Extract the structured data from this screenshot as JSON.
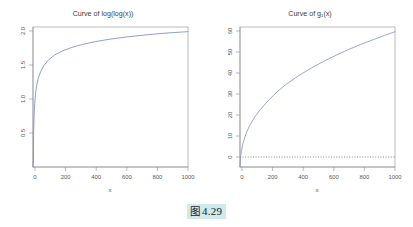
{
  "figure": {
    "caption_icon": "图",
    "caption_number": "4.29"
  },
  "chart_data": [
    {
      "type": "line",
      "title": "Curve of log(log(x))",
      "xlabel": "x",
      "ylabel": "",
      "xlim": [
        1,
        1000
      ],
      "ylim": [
        0.0,
        2.0
      ],
      "grid": false,
      "legend": null,
      "xticks": [
        0,
        200,
        400,
        600,
        800,
        1000
      ],
      "xtick_labels": [
        "0",
        "200",
        "400",
        "600",
        "800",
        "1000"
      ],
      "yticks": [
        0.5,
        1.0,
        1.5,
        2.0
      ],
      "ytick_labels": [
        "0.5",
        "1.0",
        "1.5",
        "2.0"
      ],
      "series": [
        {
          "name": "log(log(x))",
          "color": "#7a8cc4",
          "x": [
            1,
            3,
            5,
            8,
            12,
            18,
            25,
            35,
            50,
            70,
            100,
            140,
            190,
            250,
            320,
            400,
            500,
            600,
            700,
            800,
            900,
            1000
          ],
          "y": [
            0.0,
            0.094,
            0.476,
            0.733,
            0.908,
            1.059,
            1.169,
            1.269,
            1.36,
            1.446,
            1.527,
            1.6,
            1.658,
            1.707,
            1.751,
            1.79,
            1.827,
            1.857,
            1.881,
            1.902,
            1.92,
            1.933
          ]
        }
      ]
    },
    {
      "type": "line",
      "title": "Curve of g₁(x)",
      "xlabel": "x",
      "ylabel": "",
      "xlim": [
        1,
        1000
      ],
      "ylim": [
        0,
        62
      ],
      "grid": false,
      "legend": null,
      "xticks": [
        0,
        200,
        400,
        600,
        800,
        1000
      ],
      "xtick_labels": [
        "0",
        "200",
        "400",
        "600",
        "800",
        "1000"
      ],
      "yticks": [
        0,
        10,
        20,
        30,
        40,
        50,
        60
      ],
      "ytick_labels": [
        "0",
        "10",
        "20",
        "30",
        "40",
        "50",
        "60"
      ],
      "reference_lines": [
        {
          "name": "zero-line",
          "orientation": "horizontal",
          "value": 0,
          "style": "dotted",
          "color": "#555555"
        }
      ],
      "series": [
        {
          "name": "g₁(x)",
          "color": "#8a96c9",
          "x": [
            1,
            5,
            10,
            20,
            40,
            60,
            90,
            130,
            180,
            240,
            300,
            380,
            460,
            540,
            620,
            700,
            780,
            860,
            930,
            1000
          ],
          "y": [
            0.0,
            4.6,
            7.1,
            10.4,
            14.8,
            17.9,
            21.5,
            25.3,
            29.2,
            33.3,
            36.7,
            40.5,
            43.8,
            46.8,
            49.5,
            52.0,
            54.3,
            56.4,
            58.2,
            59.9
          ]
        }
      ]
    }
  ]
}
